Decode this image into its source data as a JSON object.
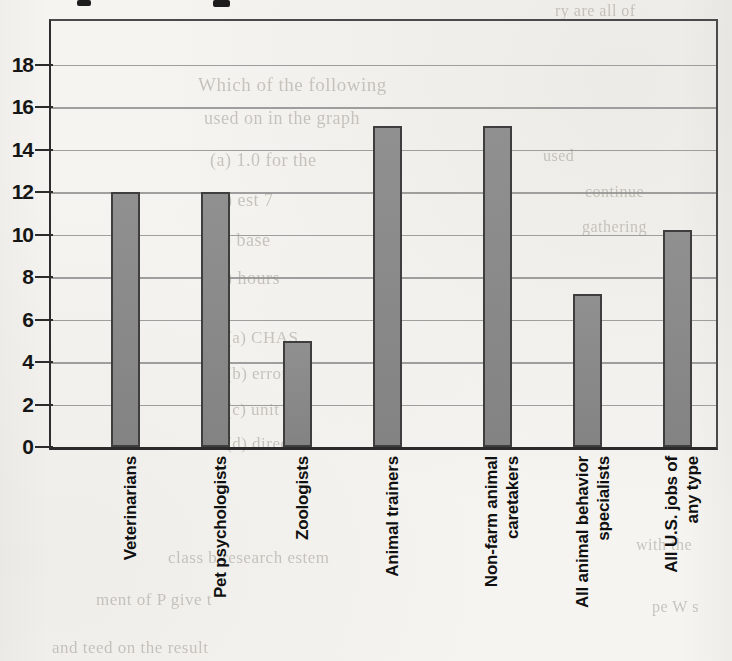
{
  "chart_data": {
    "type": "bar",
    "title": "",
    "categories": [
      "Veterinarians",
      "Pet psychologists",
      "Zoologists",
      "Animal trainers",
      "Non-farm animal\ncaretakers",
      "All animal behavior\nspecialists",
      "All U.S. jobs of\nany type"
    ],
    "values": [
      12,
      12,
      5,
      15.1,
      15.1,
      7.2,
      10.2
    ],
    "xlabel": "",
    "ylabel": "",
    "ylim": [
      0,
      20
    ],
    "yticks": [
      0,
      2,
      4,
      6,
      8,
      10,
      12,
      14,
      16,
      18
    ],
    "grid": true,
    "legend": false,
    "bar_color": "#8a8a8a",
    "bar_border_color": "#3e3e3e",
    "gridline_color": "#8f8f8f",
    "axis_color": "#2b2b2b",
    "tick_label_color": "#161616",
    "x_centers_pct": [
      11.2,
      24.8,
      37.0,
      50.6,
      67.1,
      80.7,
      94.2
    ],
    "bar_width_px": 29
  },
  "scan_artifacts": {
    "paper_color": "#f5f4f0",
    "top_edge_marks": [
      {
        "x": 77,
        "w": 14,
        "h": 6
      },
      {
        "x": 213,
        "w": 17,
        "h": 7
      }
    ],
    "ghost_lines": [
      {
        "text": "Which of the following",
        "x": 198,
        "y": 74,
        "size": 19
      },
      {
        "text": "used on in the graph",
        "x": 204,
        "y": 108,
        "size": 18
      },
      {
        "text": "(a) 1.0 for  the",
        "x": 210,
        "y": 150,
        "size": 18
      },
      {
        "text": "(b)  est 7",
        "x": 210,
        "y": 190,
        "size": 18
      },
      {
        "text": "(c)  base",
        "x": 210,
        "y": 230,
        "size": 18
      },
      {
        "text": "(d)  hours",
        "x": 210,
        "y": 268,
        "size": 18
      },
      {
        "text": "(a)   CHAS",
        "x": 226,
        "y": 328,
        "size": 17
      },
      {
        "text": "(b)  error",
        "x": 226,
        "y": 364,
        "size": 17
      },
      {
        "text": "(c)  unit",
        "x": 226,
        "y": 400,
        "size": 17
      },
      {
        "text": "(d)  direct",
        "x": 226,
        "y": 434,
        "size": 17
      },
      {
        "text": "ry are  all of",
        "x": 555,
        "y": 2,
        "size": 16
      },
      {
        "text": "used",
        "x": 543,
        "y": 147,
        "size": 16
      },
      {
        "text": "continue",
        "x": 585,
        "y": 183,
        "size": 16
      },
      {
        "text": "gathering",
        "x": 582,
        "y": 218,
        "size": 16
      },
      {
        "text": "class b research estem",
        "x": 168,
        "y": 548,
        "size": 17
      },
      {
        "text": "ment of  P give t",
        "x": 96,
        "y": 590,
        "size": 17
      },
      {
        "text": "and teed on the result",
        "x": 52,
        "y": 638,
        "size": 17
      },
      {
        "text": "with the",
        "x": 636,
        "y": 536,
        "size": 16
      },
      {
        "text": "pe  W  s",
        "x": 652,
        "y": 598,
        "size": 16
      }
    ]
  }
}
